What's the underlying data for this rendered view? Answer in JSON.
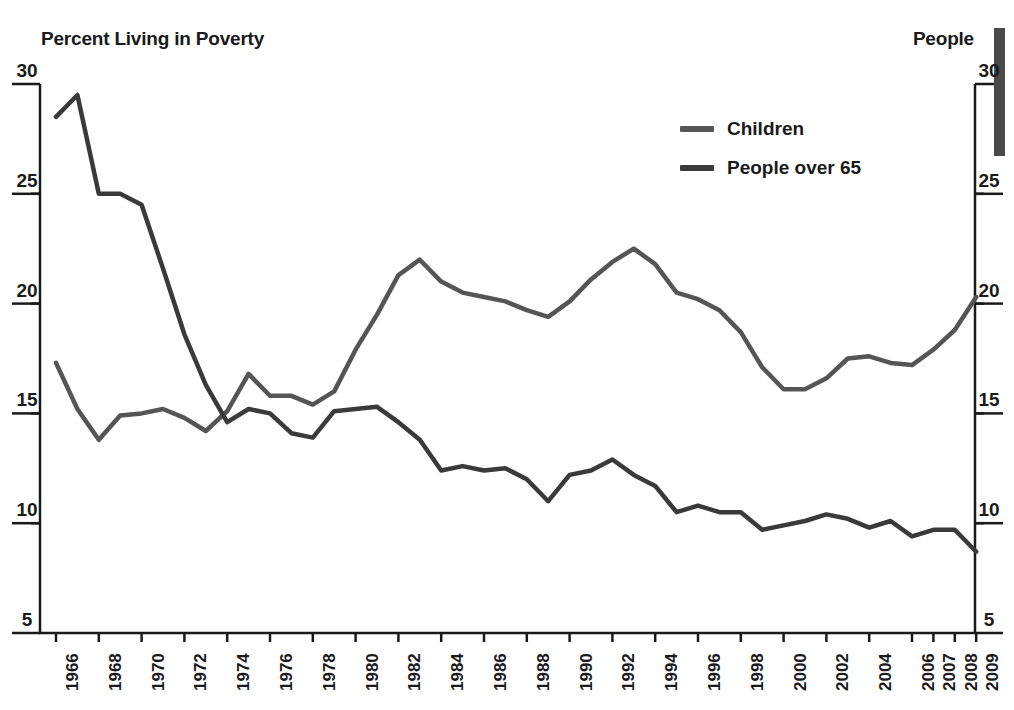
{
  "left_axis": {
    "title": "Percent Living in Poverty",
    "ticks": [
      "30",
      "25",
      "20",
      "15",
      "10",
      "5"
    ]
  },
  "right_axis": {
    "title": "People",
    "ticks": [
      "30",
      "25",
      "20",
      "15",
      "10",
      "5"
    ]
  },
  "legend": {
    "items": [
      {
        "label": "Children",
        "color": "#555555"
      },
      {
        "label": "People over 65",
        "color": "#3a3a3a"
      }
    ]
  },
  "chart_data": {
    "type": "line",
    "title": "Percent Living in Poverty",
    "xlabel": "",
    "ylabel": "Percent Living in Poverty",
    "ylim": [
      5,
      30
    ],
    "yticks": [
      5,
      10,
      15,
      20,
      25,
      30
    ],
    "grid": false,
    "legend_position": "top-right",
    "x": [
      1966,
      1967,
      1968,
      1969,
      1970,
      1971,
      1972,
      1973,
      1974,
      1975,
      1976,
      1977,
      1978,
      1979,
      1980,
      1981,
      1982,
      1983,
      1984,
      1985,
      1986,
      1987,
      1988,
      1989,
      1990,
      1991,
      1992,
      1993,
      1994,
      1995,
      1996,
      1997,
      1998,
      1999,
      2000,
      2001,
      2002,
      2003,
      2004,
      2005,
      2006,
      2007,
      2008,
      2009
    ],
    "tick_labels": [
      "1966",
      "1968",
      "1970",
      "1972",
      "1974",
      "1976",
      "1978",
      "1980",
      "1982",
      "1984",
      "1986",
      "1988",
      "1990",
      "1992",
      "1994",
      "1996",
      "1998",
      "2000",
      "2002",
      "2004",
      "2006",
      "2007",
      "2008",
      "2009"
    ],
    "series": [
      {
        "name": "Children",
        "color": "#555555",
        "values": [
          17.3,
          15.2,
          13.8,
          14.9,
          15.0,
          15.2,
          14.8,
          14.2,
          15.1,
          16.8,
          15.8,
          15.8,
          15.4,
          16.0,
          17.9,
          19.5,
          21.3,
          22.0,
          21.0,
          20.5,
          20.3,
          20.1,
          19.7,
          19.4,
          20.1,
          21.1,
          21.9,
          22.5,
          21.8,
          20.5,
          20.2,
          19.7,
          18.7,
          17.1,
          16.1,
          16.1,
          16.6,
          17.5,
          17.6,
          17.3,
          17.2,
          17.9,
          18.8,
          20.3
        ]
      },
      {
        "name": "People over 65",
        "color": "#3a3a3a",
        "values": [
          28.5,
          29.5,
          25.0,
          25.0,
          24.5,
          21.6,
          18.6,
          16.3,
          14.6,
          15.2,
          15.0,
          14.1,
          13.9,
          15.1,
          15.2,
          15.3,
          14.6,
          13.8,
          12.4,
          12.6,
          12.4,
          12.5,
          12.0,
          11.0,
          12.2,
          12.4,
          12.9,
          12.2,
          11.7,
          10.5,
          10.8,
          10.5,
          10.5,
          9.7,
          9.9,
          10.1,
          10.4,
          10.2,
          9.8,
          10.1,
          9.4,
          9.7,
          9.7,
          8.7
        ]
      }
    ]
  },
  "decor": {
    "bar_color": "#4a4a4a"
  }
}
